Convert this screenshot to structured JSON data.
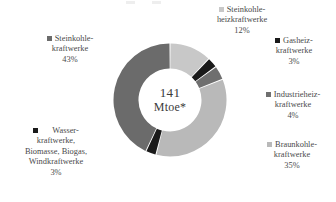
{
  "chart_data": {
    "type": "pie",
    "variant": "donut",
    "title": "",
    "center_value": "141",
    "center_unit": "Mtoe*",
    "total_label": "141 Mtoe*",
    "categories": [
      "Steinkohlekraftwerke",
      "Steinkohleheizkraftwerke",
      "Gasheizkraftwerke",
      "Industrieheizkraftwerke",
      "Braunkohlekraftwerke",
      "Wasserkraftwerke, Biomasse, Biogas, Windkraftwerke"
    ],
    "values": [
      43,
      12,
      3,
      4,
      35,
      3
    ],
    "value_labels": [
      "43%",
      "12%",
      "3%",
      "4%",
      "35%",
      "3%"
    ],
    "unit": "%",
    "colors": [
      "#6b6b6b",
      "#c8c8c8",
      "#1a1a1a",
      "#6f6f6f",
      "#b9b9b9",
      "#1a1a1a"
    ],
    "legend_position": "around-slices",
    "grid": false
  },
  "labels": {
    "steinkohlekraftwerke": {
      "line1": "Steinkohle-",
      "line2": "kraftwerke",
      "value": "43%",
      "color": "#6b6b6b"
    },
    "steinkohleheizkraftwerke": {
      "line1": "Steinkohle-",
      "line2": "heizkraftwerke",
      "value": "12%",
      "color": "#c8c8c8"
    },
    "gasheizkraftwerke": {
      "line1": "Gasheiz-",
      "line2": "kraftwerke",
      "value": "3%",
      "color": "#1a1a1a"
    },
    "industrieheizkraftwerke": {
      "line1": "Industrieheiz-",
      "line2": "kraftwerke",
      "value": "4%",
      "color": "#6f6f6f"
    },
    "braunkohlekraftwerke": {
      "line1": "Braunkohle-",
      "line2": "kraftwerke",
      "value": "35%",
      "color": "#b9b9b9"
    },
    "erneuerbare": {
      "line1": "Wasser-",
      "line2": "kraftwerke,",
      "line3": "Biomasse, Biogas,",
      "line4": "Windkraftwerke",
      "value": "3%",
      "color": "#1a1a1a"
    }
  },
  "center": {
    "value": "141",
    "unit": "Mtoe*"
  }
}
